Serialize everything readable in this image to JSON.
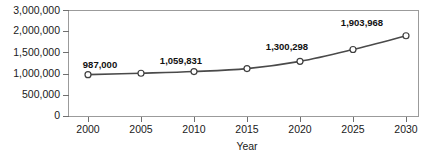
{
  "chart_data": {
    "type": "line",
    "title": "",
    "xlabel": "Year",
    "ylabel": "",
    "x": [
      2000,
      2005,
      2010,
      2015,
      2020,
      2025,
      2030
    ],
    "categories": [
      "2000",
      "2005",
      "2010",
      "2015",
      "2020",
      "2025",
      "2030"
    ],
    "values": [
      987000,
      1020000,
      1059831,
      1130000,
      1300298,
      1580000,
      1903968
    ],
    "point_labels": [
      "987,000",
      "",
      "1,059,831",
      "",
      "1,300,298",
      "",
      "1,903,968"
    ],
    "series": [
      {
        "name": "",
        "values": [
          987000,
          1020000,
          1059831,
          1130000,
          1300298,
          1580000,
          1903968
        ]
      }
    ],
    "ytick_values": [
      0,
      500000,
      1000000,
      1500000,
      2000000,
      3000000
    ],
    "ytick_labels": [
      "0",
      "500,000",
      "1,000,000",
      "1,500,000",
      "2,000,000",
      "3,000,000"
    ],
    "xtick_labels": [
      "2000",
      "2005",
      "2010",
      "2015",
      "2020",
      "2025",
      "2030"
    ],
    "ylim": [
      0,
      3000000
    ],
    "xlim": [
      2000,
      2030
    ],
    "grid": false,
    "legend": false,
    "legend_position": "none",
    "axis_note": "y-axis ticks are evenly spaced but values are non-uniform",
    "colors": {
      "line": "#4a4a4a",
      "marker_fill": "#ffffff",
      "marker_stroke": "#3f3f3f",
      "frame": "#9b9b9b",
      "text": "#1a1a1a",
      "background": "#ffffff"
    }
  },
  "labels": {
    "y0": "0",
    "y1": "500,000",
    "y2": "1,000,000",
    "y3": "1,500,000",
    "y4": "2,000,000",
    "y5": "3,000,000",
    "x0": "2000",
    "x1": "2005",
    "x2": "2010",
    "x3": "2015",
    "x4": "2020",
    "x5": "2025",
    "x6": "2030",
    "axis_x_title": "Year",
    "p0": "987,000",
    "p2": "1,059,831",
    "p4": "1,300,298",
    "p6": "1,903,968"
  }
}
